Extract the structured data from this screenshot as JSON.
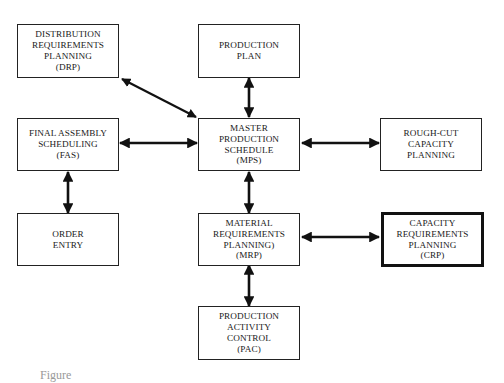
{
  "diagram": {
    "nodes": {
      "drp": {
        "lines": [
          "DISTRIBUTION",
          "REQUIREMENTS",
          "PLANNING",
          "(DRP)"
        ]
      },
      "pp": {
        "lines": [
          "PRODUCTION",
          "PLAN"
        ]
      },
      "fas": {
        "lines": [
          "FINAL ASSEMBLY",
          "SCHEDULING",
          "(FAS)"
        ]
      },
      "mps": {
        "lines": [
          "MASTER",
          "PRODUCTION",
          "SCHEDULE",
          "(MPS)"
        ]
      },
      "rccp": {
        "lines": [
          "ROUGH-CUT",
          "CAPACITY",
          "PLANNING"
        ]
      },
      "oe": {
        "lines": [
          "ORDER",
          "ENTRY"
        ]
      },
      "mrp": {
        "lines": [
          "MATERIAL",
          "REQUIREMENTS",
          "PLANNING)",
          "(MRP)"
        ]
      },
      "crp": {
        "lines": [
          "CAPACITY",
          "REQUIREMENTS",
          "PLANNING",
          "(CRP)"
        ]
      },
      "pac": {
        "lines": [
          "PRODUCTION",
          "ACTIVITY",
          "CONTROL",
          "(PAC)"
        ]
      }
    },
    "edges": [
      {
        "from": "drp",
        "to": "mps",
        "type": "bidirectional"
      },
      {
        "from": "pp",
        "to": "mps",
        "type": "bidirectional"
      },
      {
        "from": "fas",
        "to": "mps",
        "type": "bidirectional"
      },
      {
        "from": "mps",
        "to": "rccp",
        "type": "bidirectional"
      },
      {
        "from": "fas",
        "to": "oe",
        "type": "bidirectional"
      },
      {
        "from": "mps",
        "to": "mrp",
        "type": "bidirectional"
      },
      {
        "from": "mrp",
        "to": "crp",
        "type": "bidirectional"
      },
      {
        "from": "mrp",
        "to": "pac",
        "type": "bidirectional"
      }
    ],
    "highlighted_node": "crp",
    "caption": "Figure"
  }
}
